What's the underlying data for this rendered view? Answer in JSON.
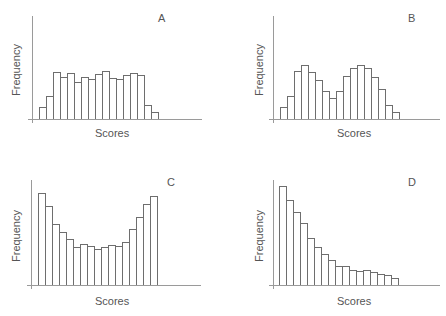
{
  "chart_data": [
    {
      "type": "bar",
      "panel": "A",
      "title": "A",
      "xlabel": "Scores",
      "ylabel": "Frequency",
      "shape": "flat / rectangular",
      "categories": [
        1,
        2,
        3,
        4,
        5,
        6,
        7,
        8,
        9,
        10,
        11,
        12,
        13,
        14,
        15,
        16,
        17
      ],
      "values": [
        12,
        23,
        47,
        42,
        46,
        37,
        42,
        40,
        45,
        48,
        41,
        40,
        44,
        46,
        44,
        14,
        7
      ],
      "grid": false
    },
    {
      "type": "bar",
      "panel": "B",
      "title": "B",
      "xlabel": "Scores",
      "ylabel": "Frequency",
      "shape": "bimodal",
      "categories": [
        1,
        2,
        3,
        4,
        5,
        6,
        7,
        8,
        9,
        10,
        11,
        12,
        13,
        14,
        15,
        16,
        17
      ],
      "values": [
        12,
        23,
        48,
        54,
        47,
        39,
        28,
        21,
        28,
        43,
        51,
        54,
        51,
        42,
        30,
        14,
        7
      ],
      "grid": false
    },
    {
      "type": "bar",
      "panel": "C",
      "title": "C",
      "xlabel": "Scores",
      "ylabel": "Frequency",
      "shape": "U-shaped",
      "categories": [
        1,
        2,
        3,
        4,
        5,
        6,
        7,
        8,
        9,
        10,
        11,
        12,
        13,
        14,
        15,
        16,
        17
      ],
      "values": [
        92,
        79,
        61,
        53,
        46,
        38,
        41,
        39,
        36,
        38,
        40,
        39,
        43,
        56,
        68,
        81,
        89
      ],
      "grid": false
    },
    {
      "type": "bar",
      "panel": "D",
      "title": "D",
      "xlabel": "Scores",
      "ylabel": "Frequency",
      "shape": "positively skewed",
      "categories": [
        1,
        2,
        3,
        4,
        5,
        6,
        7,
        8,
        9,
        10,
        11,
        12,
        13,
        14,
        15,
        16,
        17
      ],
      "values": [
        99,
        85,
        73,
        62,
        47,
        38,
        31,
        25,
        19,
        19,
        15,
        14,
        15,
        13,
        11,
        10,
        7
      ],
      "grid": false
    }
  ],
  "panels": [
    {
      "letter": "A",
      "xlabel": "Scores",
      "ylabel": "Frequency"
    },
    {
      "letter": "B",
      "xlabel": "Scores",
      "ylabel": "Frequency"
    },
    {
      "letter": "C",
      "xlabel": "Scores",
      "ylabel": "Frequency"
    },
    {
      "letter": "D",
      "xlabel": "Scores",
      "ylabel": "Frequency"
    }
  ],
  "layout": [
    {
      "yaxisX": 32,
      "axisTop": 16,
      "baseY": 119,
      "axisBottom": 123,
      "axisRight": 202,
      "barStart": 39,
      "barW": 7,
      "letterX": 158,
      "letterY": 12,
      "xlabelX": 95,
      "xlabelY": 127,
      "ylabelX": 10,
      "ylabelY": 96
    },
    {
      "yaxisX": 273,
      "axisTop": 16,
      "baseY": 119,
      "axisBottom": 123,
      "axisRight": 440,
      "barStart": 280,
      "barW": 7,
      "letterX": 408,
      "letterY": 12,
      "xlabelX": 337,
      "xlabelY": 127,
      "ylabelX": 28,
      "ylabelY": 96
    },
    {
      "yaxisX": 31,
      "axisTop": 180,
      "baseY": 285,
      "axisBottom": 289,
      "axisRight": 201,
      "barStart": 38,
      "barW": 7,
      "letterX": 167,
      "letterY": 176,
      "xlabelX": 95,
      "xlabelY": 295,
      "ylabelX": 10,
      "ylabelY": 262
    },
    {
      "yaxisX": 273,
      "axisTop": 180,
      "baseY": 285,
      "axisBottom": 289,
      "axisRight": 440,
      "barStart": 279,
      "barW": 7,
      "letterX": 408,
      "letterY": 176,
      "xlabelX": 337,
      "xlabelY": 295,
      "ylabelX": 28,
      "ylabelY": 262
    }
  ]
}
